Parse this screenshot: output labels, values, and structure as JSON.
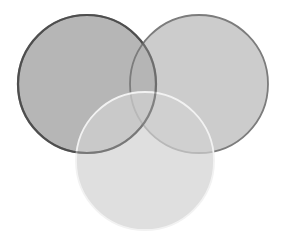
{
  "diagram": {
    "type": "venn",
    "sets": 3,
    "labels": [],
    "circles": [
      {
        "id": "left",
        "cx": 87,
        "cy": 84,
        "r": 69,
        "fill": "#9a9a9a",
        "fill_opacity": 0.72,
        "stroke": "#4f4f4f",
        "stroke_width": 2.2
      },
      {
        "id": "right",
        "cx": 199,
        "cy": 84,
        "r": 69,
        "fill": "#b4b4b4",
        "fill_opacity": 0.68,
        "stroke": "#7c7c7c",
        "stroke_width": 1.8
      },
      {
        "id": "bottom",
        "cx": 145,
        "cy": 161,
        "r": 69,
        "fill": "#d2d2d2",
        "fill_opacity": 0.7,
        "stroke": "#f2f2f2",
        "stroke_width": 1.8
      }
    ],
    "background": "#ffffff"
  }
}
